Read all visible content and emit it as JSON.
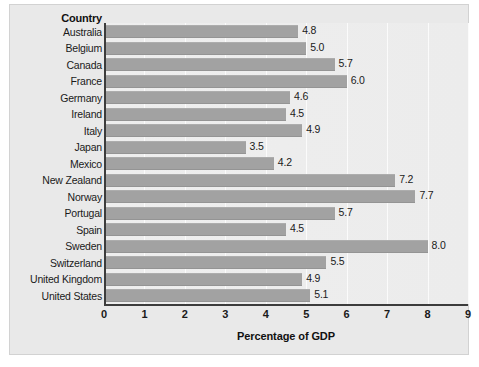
{
  "header": {
    "category_header": "Country"
  },
  "chart_data": {
    "type": "bar",
    "orientation": "horizontal",
    "title": "",
    "xlabel": "Percentage of GDP",
    "ylabel": "Country",
    "xlim": [
      0,
      9
    ],
    "xticks": [
      "0",
      "1",
      "2",
      "3",
      "4",
      "5",
      "6",
      "7",
      "8",
      "9"
    ],
    "grid": true,
    "legend": "none",
    "bar_color": "#a2a2a2",
    "plot_bg": "#ededed",
    "panel_bg": "#e9e9e9",
    "categories": [
      "Australia",
      "Belgium",
      "Canada",
      "France",
      "Germany",
      "Ireland",
      "Italy",
      "Japan",
      "Mexico",
      "New Zealand",
      "Norway",
      "Portugal",
      "Spain",
      "Sweden",
      "Switzerland",
      "United Kingdom",
      "United States"
    ],
    "values": [
      4.8,
      5.0,
      5.7,
      6.0,
      4.6,
      4.5,
      4.9,
      3.5,
      4.2,
      7.2,
      7.7,
      5.7,
      4.5,
      8.0,
      5.5,
      4.9,
      5.1
    ],
    "value_labels": [
      "4.8",
      "5.0",
      "5.7",
      "6.0",
      "4.6",
      "4.5",
      "4.9",
      "3.5",
      "4.2",
      "7.2",
      "7.7",
      "5.7",
      "4.5",
      "8.0",
      "5.5",
      "4.9",
      "5.1"
    ]
  }
}
